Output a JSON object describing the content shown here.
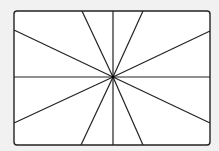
{
  "diagram": {
    "type": "radial-lines",
    "colors": {
      "background": "#f1f1f1",
      "frame_fill": "#ffffff",
      "stroke": "#222222"
    },
    "frame": {
      "x": 14,
      "y": 11,
      "width": 196,
      "height": 134,
      "corner_radius": 3
    },
    "center": {
      "x": 113,
      "y": 77
    },
    "ray_endpoints": [
      {
        "x": 82,
        "y": 11
      },
      {
        "x": 113,
        "y": 11
      },
      {
        "x": 143,
        "y": 11
      },
      {
        "x": 210,
        "y": 31
      },
      {
        "x": 210,
        "y": 77
      },
      {
        "x": 210,
        "y": 123
      },
      {
        "x": 143,
        "y": 145
      },
      {
        "x": 113,
        "y": 145
      },
      {
        "x": 81,
        "y": 145
      },
      {
        "x": 14,
        "y": 123
      },
      {
        "x": 14,
        "y": 77
      },
      {
        "x": 14,
        "y": 30
      }
    ]
  }
}
